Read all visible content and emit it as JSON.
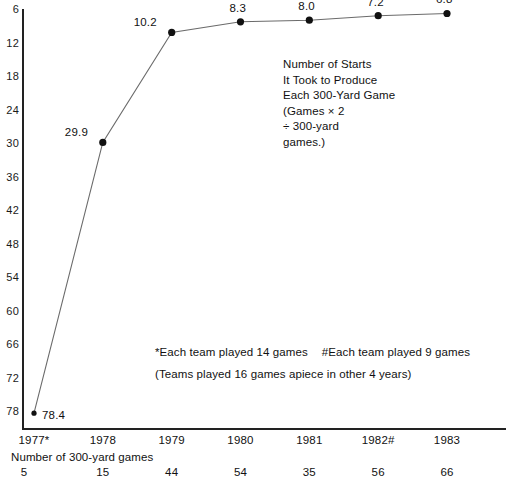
{
  "chart_data": {
    "type": "line",
    "title": "",
    "annotation": [
      "Number of Starts",
      "It Took to Produce",
      "Each 300-Yard Game",
      "(Games × 2",
      "÷ 300-yard",
      "games.)"
    ],
    "categories": [
      "1977*",
      "1978",
      "1979",
      "1980",
      "1981",
      "1982#",
      "1983"
    ],
    "values": [
      78.4,
      29.9,
      10.2,
      8.3,
      8.0,
      7.2,
      6.8
    ],
    "point_labels": [
      "78.4",
      "29.9",
      "10.2",
      "8.3",
      "8.0",
      "7.2",
      "6.8"
    ],
    "xlabel": "",
    "ylabel": "",
    "ylim": [
      6,
      78
    ],
    "y_inverted": true,
    "yticks": [
      6,
      12,
      18,
      24,
      30,
      36,
      42,
      48,
      54,
      60,
      66,
      72,
      78
    ],
    "ytick_labels": [
      "6",
      "12",
      "18",
      "24",
      "30",
      "36",
      "42",
      "48",
      "54",
      "60",
      "66",
      "72",
      "78"
    ],
    "grid": false,
    "legend": "none",
    "secondary_row": {
      "caption": "Number of 300-yard games",
      "values": [
        "5",
        "15",
        "44",
        "54",
        "35",
        "56",
        "66"
      ]
    },
    "footnotes": [
      {
        "left": "*Each team played 14 games",
        "right": "#Each team played 9 games"
      },
      {
        "left": "(Teams played 16 games apiece in other 4 years)",
        "right": ""
      }
    ],
    "colors": {
      "line": "#6b6b6b",
      "marker": "#111111",
      "axis": "#222222",
      "text": "#111111",
      "background": "#ffffff"
    }
  }
}
